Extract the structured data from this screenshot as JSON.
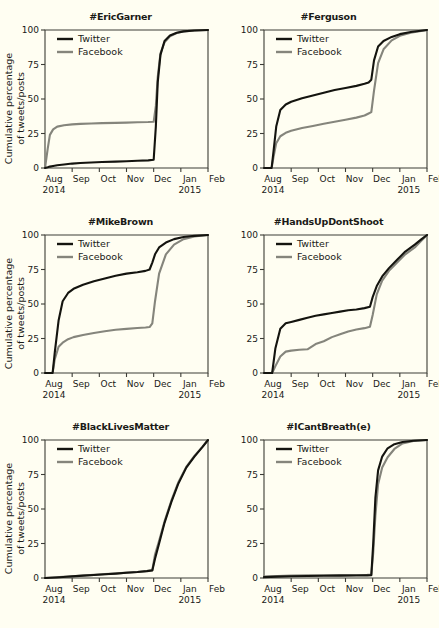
{
  "figure": {
    "background_color": "#fffef2",
    "y_axis_label_line1": "Cumulative percentage",
    "y_axis_label_line2": "of tweets/posts",
    "legend": {
      "twitter_label": "Twitter",
      "facebook_label": "Facebook",
      "twitter_color": "#14140f",
      "facebook_color": "#85857c"
    },
    "x_tick_labels": [
      "Aug",
      "Sep",
      "Oct",
      "Nov",
      "Dec",
      "Jan",
      "Feb"
    ],
    "x_year_left": "2014",
    "x_year_right": "2015",
    "y_tick_labels": [
      "0",
      "25",
      "50",
      "75",
      "100"
    ]
  },
  "chart_data": [
    {
      "type": "line",
      "title": "#EricGarner",
      "xlabel": "",
      "ylabel": "Cumulative percentage of tweets/posts",
      "ylim": [
        0,
        100
      ],
      "xlim": [
        0,
        6
      ],
      "grid": false,
      "legend_position": "top-left",
      "x_ticks": [
        0,
        1,
        2,
        3,
        4,
        5,
        6
      ],
      "x_tick_labels": [
        "Aug",
        "Sep",
        "Oct",
        "Nov",
        "Dec",
        "Jan",
        "Feb"
      ],
      "y_ticks": [
        0,
        25,
        50,
        75,
        100
      ],
      "x": [
        0.0,
        0.1,
        0.18,
        0.3,
        0.45,
        0.7,
        1.0,
        1.3,
        1.7,
        2.1,
        2.6,
        3.0,
        3.4,
        3.8,
        4.0,
        4.08,
        4.15,
        4.25,
        4.4,
        4.6,
        4.85,
        5.1,
        5.5,
        6.0
      ],
      "series": [
        {
          "name": "Twitter",
          "color": "#14140f",
          "values": [
            0,
            0.5,
            1.0,
            1.5,
            2.0,
            2.5,
            3.2,
            3.6,
            4.0,
            4.3,
            4.6,
            4.9,
            5.2,
            5.5,
            6.0,
            30,
            62,
            82,
            92,
            96,
            98,
            99,
            99.6,
            100
          ]
        },
        {
          "name": "Facebook",
          "color": "#85857c",
          "values": [
            0,
            14,
            24,
            28,
            30,
            31,
            31.6,
            32,
            32.3,
            32.5,
            32.7,
            32.9,
            33.1,
            33.3,
            33.5,
            45,
            66,
            83,
            91,
            95.5,
            97.8,
            99,
            99.6,
            100
          ]
        }
      ]
    },
    {
      "type": "line",
      "title": "#Ferguson",
      "xlabel": "",
      "ylabel": "",
      "ylim": [
        0,
        100
      ],
      "xlim": [
        0,
        6
      ],
      "grid": false,
      "legend_position": "top-left",
      "x_ticks": [
        0,
        1,
        2,
        3,
        4,
        5,
        6
      ],
      "x_tick_labels": [
        "Aug",
        "Sep",
        "Oct",
        "Nov",
        "Dec",
        "Jan",
        "Feb"
      ],
      "y_ticks": [
        0,
        25,
        50,
        75,
        100
      ],
      "x": [
        0.0,
        0.28,
        0.35,
        0.45,
        0.6,
        0.8,
        1.0,
        1.4,
        1.8,
        2.2,
        2.6,
        3.0,
        3.4,
        3.7,
        3.85,
        3.95,
        4.05,
        4.2,
        4.4,
        4.7,
        5.0,
        5.4,
        6.0
      ],
      "series": [
        {
          "name": "Twitter",
          "color": "#14140f",
          "values": [
            0,
            0,
            12,
            30,
            42,
            46,
            48,
            50.5,
            52.5,
            54.5,
            56.5,
            58,
            59.5,
            61,
            62,
            64,
            78,
            88,
            92,
            95,
            97,
            98.5,
            100
          ]
        },
        {
          "name": "Facebook",
          "color": "#85857c",
          "values": [
            0,
            0,
            8,
            18,
            23,
            25.5,
            27,
            29,
            30.5,
            32,
            33.5,
            35,
            36.5,
            38,
            39.5,
            40.5,
            56,
            76,
            86,
            92.5,
            95.8,
            98,
            100
          ]
        }
      ]
    },
    {
      "type": "line",
      "title": "#MikeBrown",
      "xlabel": "",
      "ylabel": "Cumulative percentage of tweets/posts",
      "ylim": [
        0,
        100
      ],
      "xlim": [
        0,
        6
      ],
      "grid": false,
      "legend_position": "top-left",
      "x_ticks": [
        0,
        1,
        2,
        3,
        4,
        5,
        6
      ],
      "x_tick_labels": [
        "Aug",
        "Sep",
        "Oct",
        "Nov",
        "Dec",
        "Jan",
        "Feb"
      ],
      "y_ticks": [
        0,
        25,
        50,
        75,
        100
      ],
      "x": [
        0.0,
        0.28,
        0.36,
        0.5,
        0.65,
        0.85,
        1.05,
        1.4,
        1.8,
        2.2,
        2.6,
        3.0,
        3.4,
        3.7,
        3.85,
        3.95,
        4.05,
        4.2,
        4.45,
        4.75,
        5.1,
        5.5,
        6.0
      ],
      "series": [
        {
          "name": "Twitter",
          "color": "#14140f",
          "values": [
            0,
            0,
            15,
            38,
            52,
            58,
            61,
            64,
            66.5,
            68.5,
            70.5,
            72,
            73,
            74,
            75,
            80,
            86,
            91,
            94.5,
            97,
            98.5,
            99.4,
            100
          ]
        },
        {
          "name": "Facebook",
          "color": "#85857c",
          "values": [
            0,
            0,
            10,
            19,
            22,
            24.5,
            26,
            27.5,
            29,
            30.3,
            31.3,
            32,
            32.6,
            33,
            33.3,
            36,
            52,
            72,
            86,
            93,
            97,
            99,
            100
          ]
        }
      ]
    },
    {
      "type": "line",
      "title": "#HandsUpDontShoot",
      "xlabel": "",
      "ylabel": "",
      "ylim": [
        0,
        100
      ],
      "xlim": [
        0,
        6
      ],
      "grid": false,
      "legend_position": "top-left",
      "x_ticks": [
        0,
        1,
        2,
        3,
        4,
        5,
        6
      ],
      "x_tick_labels": [
        "Aug",
        "Sep",
        "Oct",
        "Nov",
        "Dec",
        "Jan",
        "Feb"
      ],
      "y_ticks": [
        0,
        25,
        50,
        75,
        100
      ],
      "x": [
        0.0,
        0.3,
        0.42,
        0.6,
        0.8,
        1.0,
        1.3,
        1.6,
        1.9,
        2.2,
        2.5,
        2.8,
        3.1,
        3.4,
        3.7,
        3.9,
        4.0,
        4.15,
        4.35,
        4.6,
        4.9,
        5.2,
        5.55,
        5.8,
        6.0
      ],
      "series": [
        {
          "name": "Twitter",
          "color": "#14140f",
          "values": [
            0,
            0,
            18,
            32,
            36,
            37,
            38.5,
            40,
            41.5,
            42.5,
            43.5,
            44.5,
            45.5,
            46,
            47,
            48,
            55,
            63,
            70,
            76,
            82,
            88,
            93,
            97,
            100
          ]
        },
        {
          "name": "Facebook",
          "color": "#85857c",
          "values": [
            0,
            0,
            5,
            12,
            15.5,
            16.2,
            16.8,
            17.2,
            21,
            23,
            26,
            28,
            30,
            31.5,
            32.5,
            33.5,
            42,
            57,
            67,
            74,
            80,
            86,
            91,
            96,
            100
          ]
        }
      ]
    },
    {
      "type": "line",
      "title": "#BlackLivesMatter",
      "xlabel": "",
      "ylabel": "Cumulative percentage of tweets/posts",
      "ylim": [
        0,
        100
      ],
      "xlim": [
        0,
        6
      ],
      "grid": false,
      "legend_position": "top-left",
      "x_ticks": [
        0,
        1,
        2,
        3,
        4,
        5,
        6
      ],
      "x_tick_labels": [
        "Aug",
        "Sep",
        "Oct",
        "Nov",
        "Dec",
        "Jan",
        "Feb"
      ],
      "y_ticks": [
        0,
        25,
        50,
        75,
        100
      ],
      "x": [
        0.0,
        0.4,
        0.8,
        1.0,
        1.4,
        1.8,
        2.2,
        2.6,
        3.0,
        3.4,
        3.75,
        3.95,
        4.05,
        4.2,
        4.4,
        4.65,
        4.9,
        5.2,
        5.5,
        5.8,
        6.0
      ],
      "series": [
        {
          "name": "Twitter",
          "color": "#14140f",
          "values": [
            0,
            0.4,
            0.9,
            1.2,
            1.7,
            2.2,
            2.7,
            3.2,
            3.8,
            4.3,
            5.0,
            5.5,
            14,
            25,
            40,
            55,
            68,
            80,
            88,
            95,
            100
          ]
        },
        {
          "name": "Facebook",
          "color": "#85857c",
          "values": [
            0,
            0.5,
            1.0,
            1.3,
            1.8,
            2.3,
            2.8,
            3.3,
            3.9,
            4.4,
            5.1,
            5.6,
            17,
            27,
            41,
            56,
            69,
            80.5,
            88.5,
            95.2,
            100
          ]
        }
      ]
    },
    {
      "type": "line",
      "title": "#ICantBreath(e)",
      "xlabel": "",
      "ylabel": "",
      "ylim": [
        0,
        100
      ],
      "xlim": [
        0,
        6
      ],
      "grid": false,
      "legend_position": "top-left",
      "x_ticks": [
        0,
        1,
        2,
        3,
        4,
        5,
        6
      ],
      "x_tick_labels": [
        "Aug",
        "Sep",
        "Oct",
        "Nov",
        "Dec",
        "Jan",
        "Feb"
      ],
      "y_ticks": [
        0,
        25,
        50,
        75,
        100
      ],
      "x": [
        0.0,
        0.5,
        1.0,
        1.6,
        2.2,
        2.8,
        3.4,
        3.8,
        3.95,
        4.02,
        4.1,
        4.2,
        4.35,
        4.55,
        4.8,
        5.1,
        5.5,
        6.0
      ],
      "series": [
        {
          "name": "Twitter",
          "color": "#14140f",
          "values": [
            0.6,
            1.0,
            1.3,
            1.5,
            1.6,
            1.7,
            1.8,
            1.9,
            2.0,
            25,
            58,
            78,
            88,
            94,
            97,
            98.6,
            99.5,
            100
          ]
        },
        {
          "name": "Facebook",
          "color": "#85857c",
          "values": [
            1.0,
            1.4,
            1.7,
            1.9,
            2.0,
            2.1,
            2.2,
            2.3,
            2.4,
            18,
            45,
            68,
            80,
            87.5,
            93.5,
            97.5,
            99.3,
            100
          ]
        }
      ]
    }
  ]
}
